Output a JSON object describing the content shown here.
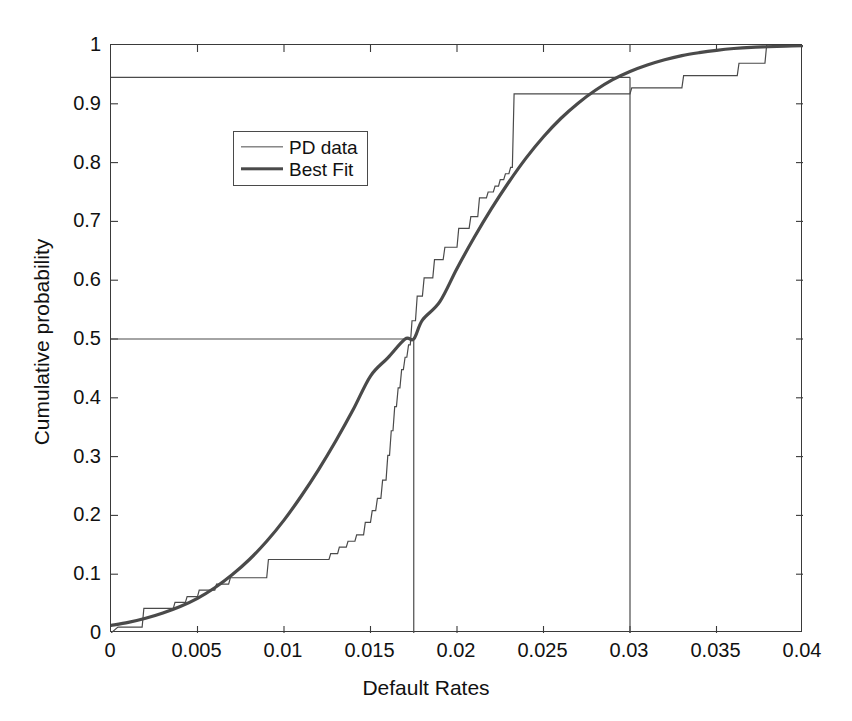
{
  "chart_data": {
    "type": "line",
    "title": "",
    "xlabel": "Default Rates",
    "ylabel": "Cumulative probability",
    "xlim": [
      0,
      0.04
    ],
    "ylim": [
      0,
      1
    ],
    "grid": false,
    "legend_position": "upper left",
    "xticks": [
      "0",
      "0.005",
      "0.01",
      "0.015",
      "0.02",
      "0.025",
      "0.03",
      "0.035",
      "0.04"
    ],
    "xtick_values": [
      0,
      0.005,
      0.01,
      0.015,
      0.02,
      0.025,
      0.03,
      0.035,
      0.04
    ],
    "yticks": [
      "0",
      "0.1",
      "0.2",
      "0.3",
      "0.4",
      "0.5",
      "0.6",
      "0.7",
      "0.8",
      "0.9",
      "1"
    ],
    "ytick_values": [
      0,
      0.1,
      0.2,
      0.3,
      0.4,
      0.5,
      0.6,
      0.7,
      0.8,
      0.9,
      1
    ],
    "series": [
      {
        "name": "PD data",
        "style": "step",
        "color": "#4a4a4a",
        "linewidth": 1.2,
        "x": [
          0.0,
          0.0004,
          0.0018,
          0.0019,
          0.0036,
          0.0037,
          0.0043,
          0.0044,
          0.005,
          0.0051,
          0.006,
          0.0061,
          0.0068,
          0.0069,
          0.009,
          0.0091,
          0.0126,
          0.0127,
          0.0131,
          0.0132,
          0.0136,
          0.0137,
          0.0141,
          0.0142,
          0.0146,
          0.0147,
          0.015,
          0.0151,
          0.0153,
          0.0154,
          0.0156,
          0.0157,
          0.0159,
          0.016,
          0.0161,
          0.0162,
          0.0163,
          0.0164,
          0.0165,
          0.0166,
          0.0167,
          0.0168,
          0.0169,
          0.017,
          0.0171,
          0.0172,
          0.0173,
          0.0174,
          0.0176,
          0.0177,
          0.018,
          0.0181,
          0.0186,
          0.0187,
          0.0192,
          0.0193,
          0.02,
          0.0201,
          0.0207,
          0.0208,
          0.0212,
          0.0213,
          0.0217,
          0.0218,
          0.0221,
          0.0222,
          0.0224,
          0.0225,
          0.0227,
          0.0228,
          0.023,
          0.0231,
          0.0232,
          0.0233,
          0.03,
          0.0301,
          0.033,
          0.0331,
          0.0362,
          0.0363,
          0.0378,
          0.0379,
          0.04
        ],
        "y": [
          0.0,
          0.01,
          0.01,
          0.042,
          0.042,
          0.052,
          0.052,
          0.062,
          0.062,
          0.073,
          0.073,
          0.083,
          0.083,
          0.094,
          0.094,
          0.125,
          0.125,
          0.135,
          0.135,
          0.146,
          0.146,
          0.156,
          0.156,
          0.167,
          0.167,
          0.188,
          0.188,
          0.208,
          0.208,
          0.229,
          0.229,
          0.26,
          0.26,
          0.302,
          0.302,
          0.344,
          0.344,
          0.385,
          0.385,
          0.417,
          0.417,
          0.448,
          0.448,
          0.469,
          0.469,
          0.49,
          0.49,
          0.531,
          0.531,
          0.573,
          0.573,
          0.604,
          0.604,
          0.635,
          0.635,
          0.656,
          0.656,
          0.688,
          0.688,
          0.708,
          0.708,
          0.74,
          0.74,
          0.75,
          0.75,
          0.76,
          0.76,
          0.771,
          0.771,
          0.781,
          0.781,
          0.792,
          0.792,
          0.917,
          0.917,
          0.927,
          0.927,
          0.948,
          0.948,
          0.969,
          0.969,
          1.0,
          1.0
        ]
      },
      {
        "name": "Best Fit",
        "style": "smooth",
        "color": "#4a4a4a",
        "linewidth": 3.2,
        "distribution": "normal-cdf",
        "mu": 0.0175,
        "sigma": 0.0079,
        "x": [
          0.0,
          0.001,
          0.002,
          0.003,
          0.004,
          0.005,
          0.006,
          0.007,
          0.008,
          0.009,
          0.01,
          0.011,
          0.012,
          0.013,
          0.014,
          0.015,
          0.016,
          0.017,
          0.0175,
          0.018,
          0.019,
          0.02,
          0.021,
          0.022,
          0.023,
          0.024,
          0.025,
          0.026,
          0.027,
          0.028,
          0.029,
          0.03,
          0.031,
          0.032,
          0.033,
          0.034,
          0.035,
          0.036,
          0.037,
          0.038,
          0.039,
          0.04
        ],
        "y": [
          0.013,
          0.018,
          0.025,
          0.034,
          0.045,
          0.059,
          0.077,
          0.099,
          0.125,
          0.156,
          0.192,
          0.233,
          0.278,
          0.327,
          0.38,
          0.437,
          0.468,
          0.5,
          0.5,
          0.532,
          0.563,
          0.62,
          0.673,
          0.722,
          0.767,
          0.808,
          0.844,
          0.875,
          0.901,
          0.923,
          0.941,
          0.955,
          0.966,
          0.975,
          0.982,
          0.987,
          0.991,
          0.994,
          0.996,
          0.997,
          0.998,
          0.999
        ]
      }
    ],
    "annotations": [
      {
        "type": "hline",
        "y": 0.5,
        "x_from": 0.0,
        "x_to": 0.0175,
        "color": "#4a4a4a"
      },
      {
        "type": "vline",
        "x": 0.0175,
        "y_from": 0.0,
        "y_to": 0.5,
        "color": "#4a4a4a"
      },
      {
        "type": "hline",
        "y": 0.945,
        "x_from": 0.0,
        "x_to": 0.03,
        "color": "#4a4a4a"
      },
      {
        "type": "vline",
        "x": 0.03,
        "y_from": 0.0,
        "y_to": 0.945,
        "color": "#4a4a4a"
      }
    ]
  },
  "legend": {
    "items": [
      {
        "label": "PD data",
        "style": "thin"
      },
      {
        "label": "Best Fit",
        "style": "thick"
      }
    ]
  }
}
